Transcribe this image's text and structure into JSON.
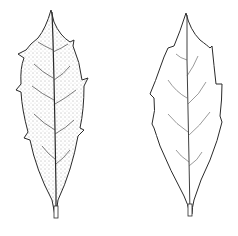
{
  "figure": {
    "colors": {
      "background": "#ffffff",
      "ink": "#2a2a2a",
      "stipple": "#555555"
    },
    "leaves": [
      {
        "id": "left",
        "style": "stippled",
        "position": "left"
      },
      {
        "id": "right",
        "style": "outline",
        "position": "right"
      }
    ]
  }
}
